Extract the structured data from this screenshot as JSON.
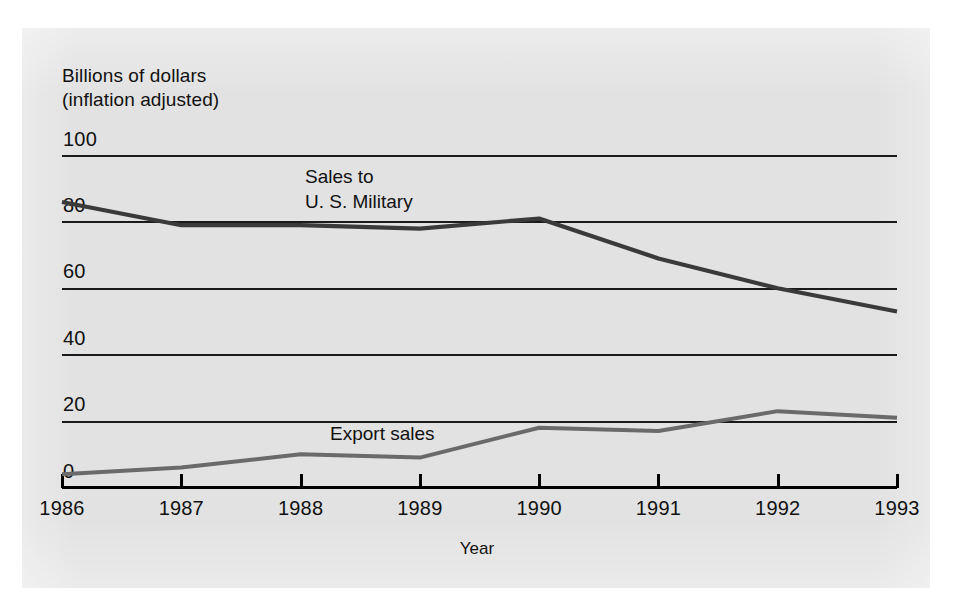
{
  "panel": {
    "background_color": "#e2e2e2",
    "page_background_color": "#ffffff"
  },
  "axis_titles": {
    "y": "Billions of dollars\n(inflation adjusted)",
    "x": "Year"
  },
  "series_labels": {
    "military": "Sales to\nU. S. Military",
    "export": "Export sales"
  },
  "colors": {
    "military_line": "#3a3a3a",
    "export_line": "#6a6a6a",
    "gridline": "#1a1a1a",
    "axis": "#000000",
    "text": "#111111"
  },
  "chart_data": {
    "type": "line",
    "title": "",
    "xlabel": "Year",
    "ylabel": "Billions of dollars (inflation adjusted)",
    "categories": [
      "1986",
      "1987",
      "1988",
      "1989",
      "1990",
      "1991",
      "1992",
      "1993"
    ],
    "x": [
      1986,
      1987,
      1988,
      1989,
      1990,
      1991,
      1992,
      1993
    ],
    "ylim": [
      0,
      100
    ],
    "xlim": [
      1986,
      1993
    ],
    "yticks": [
      0,
      20,
      40,
      60,
      80,
      100
    ],
    "ytick_labels": [
      "0",
      "20",
      "40",
      "60",
      "80",
      "100"
    ],
    "xtick_labels": [
      "1986",
      "1987",
      "1988",
      "1989",
      "1990",
      "1991",
      "1992",
      "1993"
    ],
    "grid": true,
    "grid_axis": "y",
    "legend": "inline-labels",
    "series": [
      {
        "name": "Sales to U. S. Military",
        "color": "#3a3a3a",
        "values": [
          86,
          79,
          79,
          78,
          81,
          69,
          60,
          53
        ]
      },
      {
        "name": "Export sales",
        "color": "#6a6a6a",
        "values": [
          4,
          6,
          10,
          9,
          18,
          17,
          23,
          21
        ]
      }
    ],
    "annotations": [
      {
        "text": "Sales to U. S. Military",
        "near_x": 1988,
        "near_y": 92
      },
      {
        "text": "Export sales",
        "near_x": 1988,
        "near_y": 14
      }
    ]
  }
}
